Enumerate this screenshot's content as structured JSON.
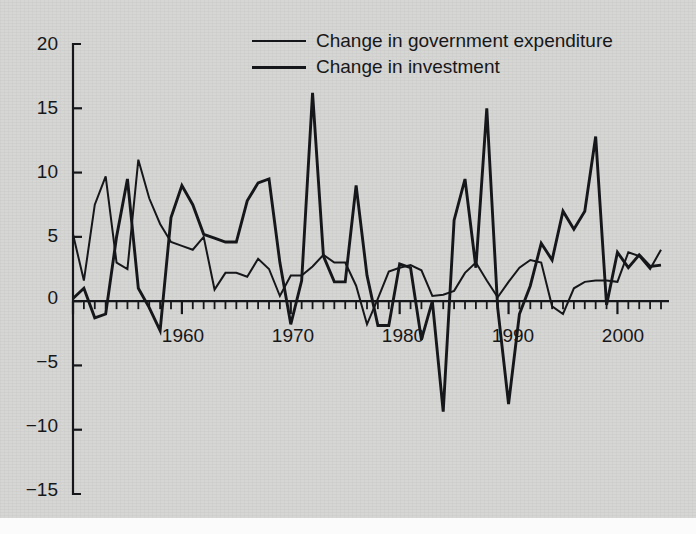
{
  "figure": {
    "background_color": "#d6d6d4",
    "ink_color": "#16171a"
  },
  "legend": {
    "position": "top-center",
    "entries": [
      {
        "label": "Change in government expenditure",
        "style": "thin",
        "color": "#16171a"
      },
      {
        "label": "Change in investment",
        "style": "thick",
        "color": "#16171a"
      }
    ]
  },
  "axes": {
    "y_ticks": [
      "20",
      "15",
      "10",
      "5",
      "0",
      "−5",
      "−10",
      "−15"
    ],
    "x_ticks": [
      "1960",
      "1970",
      "1980",
      "1990",
      "2000"
    ]
  },
  "chart_data": {
    "type": "line",
    "title": "",
    "xlabel": "",
    "ylabel": "",
    "xlim": [
      1950,
      2004
    ],
    "ylim": [
      -15,
      20
    ],
    "y_ticks": [
      20,
      15,
      10,
      5,
      0,
      -5,
      -10,
      -15
    ],
    "x_ticks": [
      1960,
      1970,
      1980,
      1990,
      2000
    ],
    "x_minor_tick_interval": 1,
    "grid": false,
    "legend_position": "top-center",
    "x": [
      1950,
      1951,
      1952,
      1953,
      1954,
      1955,
      1956,
      1957,
      1958,
      1959,
      1960,
      1961,
      1962,
      1963,
      1964,
      1965,
      1966,
      1967,
      1968,
      1969,
      1970,
      1971,
      1972,
      1973,
      1974,
      1975,
      1976,
      1977,
      1978,
      1979,
      1980,
      1981,
      1982,
      1983,
      1984,
      1985,
      1986,
      1987,
      1988,
      1989,
      1990,
      1991,
      1992,
      1993,
      1994,
      1995,
      1996,
      1997,
      1998,
      1999,
      2000,
      2001,
      2002,
      2003,
      2004
    ],
    "series": [
      {
        "name": "Change in government expenditure",
        "style": "thin",
        "color": "#16171a",
        "values": [
          5.2,
          1.6,
          7.5,
          9.7,
          3.0,
          2.5,
          11.0,
          8.0,
          6.0,
          4.6,
          4.3,
          4.0,
          5.0,
          0.9,
          2.2,
          2.2,
          1.9,
          3.3,
          2.5,
          0.4,
          2.0,
          2.0,
          2.7,
          3.6,
          3.0,
          3.0,
          1.2,
          -1.8,
          0.2,
          2.3,
          2.6,
          2.8,
          2.4,
          0.4,
          0.5,
          0.8,
          2.2,
          3.0,
          1.6,
          0.3,
          1.5,
          2.6,
          3.2,
          3.0,
          -0.4,
          -1.0,
          1.0,
          1.5,
          1.6,
          1.6,
          1.5,
          3.8,
          3.5,
          2.5,
          4.0
        ]
      },
      {
        "name": "Change in investment",
        "style": "thick",
        "color": "#16171a",
        "values": [
          0.2,
          1.0,
          -1.3,
          -1.0,
          5.0,
          9.5,
          1.0,
          -0.5,
          -2.3,
          6.5,
          9.0,
          7.5,
          5.2,
          4.9,
          4.6,
          4.6,
          7.8,
          9.2,
          9.5,
          3.0,
          -1.8,
          1.6,
          16.2,
          3.5,
          1.5,
          1.5,
          9.0,
          2.0,
          -1.9,
          -1.9,
          2.9,
          2.6,
          -3.0,
          0.0,
          -8.6,
          6.3,
          9.5,
          2.6,
          15.0,
          -0.5,
          -8.0,
          -1.0,
          1.2,
          4.5,
          3.2,
          7.0,
          5.6,
          7.0,
          12.8,
          -0.3,
          3.8,
          2.6,
          3.6,
          2.7,
          2.8
        ]
      }
    ]
  }
}
